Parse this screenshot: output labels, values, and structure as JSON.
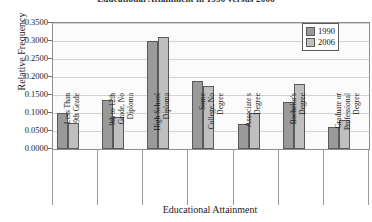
{
  "chart_data": {
    "type": "bar",
    "title": "Educational Attainment in 1990 versus 2006",
    "xlabel": "Educational Attainment",
    "ylabel": "Relative Frequency",
    "ylim": [
      0.0,
      0.35
    ],
    "ytick_labels": [
      "0.3500",
      "0.3000",
      "0.2500",
      "0.2000",
      "0.1500",
      "0.1000",
      "0.0500",
      "0.0000"
    ],
    "ytick_values": [
      0.35,
      0.3,
      0.25,
      0.2,
      0.15,
      0.1,
      0.05,
      0.0
    ],
    "grid": true,
    "legend_position": "top-right",
    "categories": [
      "Less Than 9th Grade",
      "9th to 12th Grade, No Diploma",
      "High School Diploma",
      "Some College, No Degree",
      "Associate s Degree",
      "Bachelor's Degree",
      "Graduate or Professional Degree"
    ],
    "category_lines": [
      [
        "Less Than",
        "9th Grade"
      ],
      [
        "9th to 12th",
        "Grade, No",
        "Diploma"
      ],
      [
        "High School",
        "Diploma"
      ],
      [
        "Some",
        "College, No",
        "Degree"
      ],
      [
        "Associate s",
        "Degree"
      ],
      [
        "Bachelor's",
        "Degree"
      ],
      [
        "Graduate or",
        "Professional",
        "Degree"
      ]
    ],
    "series": [
      {
        "name": "1990",
        "color": "#9a9a9a",
        "values": [
          0.1,
          0.135,
          0.3,
          0.19,
          0.07,
          0.13,
          0.06
        ]
      },
      {
        "name": "2006",
        "color": "#bfbfbf",
        "values": [
          0.072,
          0.09,
          0.312,
          0.175,
          0.1,
          0.18,
          0.08
        ]
      }
    ]
  },
  "legend": {
    "entries": [
      {
        "label": "1990"
      },
      {
        "label": "2006"
      }
    ]
  }
}
